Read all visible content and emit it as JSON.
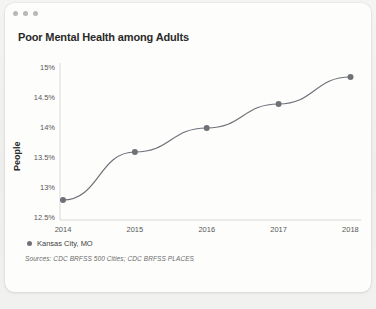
{
  "window": {
    "dots": [
      "close-dot",
      "minimize-dot",
      "maximize-dot"
    ]
  },
  "header": {
    "title": "Poor Mental Health among Adults"
  },
  "chart_data": {
    "type": "line",
    "title": "Poor Mental Health among Adults",
    "xlabel": "",
    "ylabel": "People",
    "categories": [
      "2014",
      "2015",
      "2016",
      "2017",
      "2018"
    ],
    "x": [
      2014,
      2015,
      2016,
      2017,
      2018
    ],
    "series": [
      {
        "name": "Kansas City, MO",
        "color": "#6e7278",
        "values": [
          12.8,
          13.6,
          14.0,
          14.4,
          14.85
        ]
      }
    ],
    "ylim": [
      12.5,
      15.0
    ],
    "yticks": [
      "12.5%",
      "13%",
      "13.5%",
      "14%",
      "14.5%",
      "15%"
    ],
    "ytick_values": [
      12.5,
      13,
      13.5,
      14,
      14.5,
      15
    ],
    "xticks": [
      "2014",
      "2015",
      "2016",
      "2017",
      "2018"
    ],
    "grid": false,
    "legend_position": "bottom-left",
    "markers": true,
    "annotations": []
  },
  "legend": {
    "entries": [
      {
        "label": "Kansas City, MO",
        "color": "#6e7278"
      }
    ]
  },
  "footer": {
    "sources": "Sources: CDC BRFSS 500 Cities; CDC BRFSS PLACES"
  },
  "colors": {
    "line": "#6e7278",
    "axis": "#d8d8d6",
    "text": "#2a2a2a",
    "muted": "#575757",
    "card": "#fdfdfc",
    "page": "#f2f2f0"
  }
}
